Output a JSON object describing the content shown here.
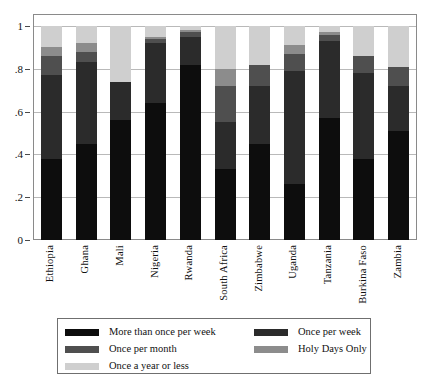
{
  "chart_data": {
    "type": "bar",
    "stacked": true,
    "title": "",
    "xlabel": "",
    "ylabel": "",
    "ylim": [
      0,
      1
    ],
    "yticks": [
      "0",
      ".2",
      ".4",
      ".6",
      ".8",
      "1"
    ],
    "ytick_values": [
      0,
      0.2,
      0.4,
      0.6,
      0.8,
      1
    ],
    "grid": true,
    "legend_position": "below",
    "categories": [
      "Ethiopia",
      "Ghana",
      "Mali",
      "Nigeria",
      "Rwanda",
      "South Africa",
      "Zimbabwe",
      "Uganda",
      "Tanzania",
      "Burkina Faso",
      "Zambia"
    ],
    "series": [
      {
        "name": "More than once per week",
        "color": "#0d0d0d",
        "values": [
          0.38,
          0.45,
          0.56,
          0.64,
          0.82,
          0.33,
          0.45,
          0.26,
          0.57,
          0.38,
          0.51
        ]
      },
      {
        "name": "Once per week",
        "color": "#2b2b2b",
        "values": [
          0.39,
          0.38,
          0.18,
          0.28,
          0.13,
          0.22,
          0.27,
          0.53,
          0.36,
          0.4,
          0.21
        ]
      },
      {
        "name": "Once per month",
        "color": "#4f4f4f",
        "values": [
          0.09,
          0.05,
          0.0,
          0.02,
          0.02,
          0.17,
          0.1,
          0.08,
          0.03,
          0.08,
          0.09
        ]
      },
      {
        "name": "Holy Days Only",
        "color": "#8c8c8c",
        "values": [
          0.04,
          0.04,
          0.0,
          0.01,
          0.01,
          0.08,
          0.0,
          0.04,
          0.01,
          0.0,
          0.0
        ]
      },
      {
        "name": "Once a year or less",
        "color": "#cfcfcf",
        "values": [
          0.1,
          0.08,
          0.26,
          0.05,
          0.02,
          0.2,
          0.18,
          0.09,
          0.03,
          0.14,
          0.19
        ]
      }
    ]
  },
  "legend": {
    "left_column": [
      {
        "label": "More than once per week",
        "color": "#0d0d0d"
      },
      {
        "label": "Once per month",
        "color": "#4f4f4f"
      },
      {
        "label": "Once a year or less",
        "color": "#cfcfcf"
      }
    ],
    "right_column": [
      {
        "label": "Once per week",
        "color": "#2b2b2b"
      },
      {
        "label": "Holy Days Only",
        "color": "#8c8c8c"
      }
    ]
  }
}
